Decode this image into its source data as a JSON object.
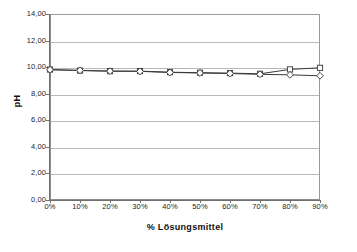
{
  "chart_data": {
    "type": "line",
    "title": "",
    "xlabel": "% Lösungsmittel",
    "ylabel": "pH",
    "x": [
      0,
      10,
      20,
      30,
      40,
      50,
      60,
      70,
      80,
      90
    ],
    "categories": [
      "0%",
      "10%",
      "20%",
      "30%",
      "40%",
      "50%",
      "60%",
      "70%",
      "80%",
      "90%"
    ],
    "xtick_labels": [
      "0%",
      "10%",
      "20%",
      "30%",
      "40%",
      "50%",
      "60%",
      "70%",
      "80%",
      "90%"
    ],
    "ytick_labels": [
      "0,00",
      "2,00",
      "4,00",
      "6,00",
      "8,00",
      "10,00",
      "12,00",
      "14,00"
    ],
    "ytick_values": [
      0,
      2,
      4,
      6,
      8,
      10,
      12,
      14
    ],
    "ylim": [
      0,
      14
    ],
    "xlim": [
      0,
      90
    ],
    "grid": "horizontal",
    "legend": "none",
    "series": [
      {
        "name": "series-square",
        "marker": "square",
        "color": "#3a3a3a",
        "values": [
          9.82,
          9.74,
          9.7,
          9.7,
          9.62,
          9.58,
          9.55,
          9.5,
          9.83,
          9.95
        ]
      },
      {
        "name": "series-diamond",
        "marker": "diamond",
        "color": "#3a3a3a",
        "values": [
          9.8,
          9.76,
          9.7,
          9.68,
          9.6,
          9.56,
          9.52,
          9.46,
          9.42,
          9.35
        ]
      }
    ]
  },
  "axes": {
    "y_title": "pH",
    "x_title": "% Lösungsmittel"
  },
  "footer": {
    "clipped_text": ""
  },
  "colors": {
    "plot_border": "#8d8d8d",
    "gridline": "#b8b8b8",
    "axis": "#6f6f6f",
    "line": "#3a3a3a",
    "background": "#ffffff"
  }
}
